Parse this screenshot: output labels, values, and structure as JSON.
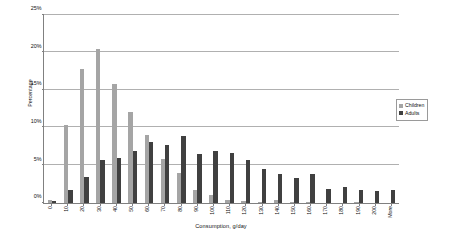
{
  "chart_data": {
    "type": "bar",
    "title": "",
    "xlabel": "Consumption, g/day",
    "ylabel": "Percentage",
    "ylim": [
      0,
      25
    ],
    "ytick_labels": [
      "0%",
      "5%",
      "10%",
      "15%",
      "20%",
      "25%"
    ],
    "ytick_values": [
      0,
      5,
      10,
      15,
      20,
      25
    ],
    "grid": true,
    "legend_position": "right",
    "categories": [
      "0",
      "10",
      "20",
      "30",
      "40",
      "50",
      "60",
      "70",
      "80",
      "90",
      "100",
      "110",
      "120",
      "130",
      "140",
      "150",
      "160",
      "170",
      "180",
      "190",
      "200",
      "More"
    ],
    "series": [
      {
        "name": "Children",
        "color": "#a5a5a5",
        "values": [
          0.3,
          10.3,
          17.8,
          20.4,
          15.8,
          12.1,
          9.0,
          5.8,
          3.9,
          1.6,
          1.0,
          0.4,
          0.2,
          0.1,
          0.3,
          0.05,
          0.05,
          0.0,
          0.0,
          0.05,
          0.0,
          0.0
        ]
      },
      {
        "name": "Adults",
        "color": "#404040",
        "values": [
          0.15,
          1.6,
          3.4,
          5.6,
          5.9,
          6.8,
          8.1,
          7.7,
          8.9,
          6.5,
          6.9,
          6.6,
          5.6,
          4.4,
          3.8,
          3.2,
          3.8,
          1.8,
          2.1,
          1.6,
          1.5,
          1.7
        ]
      }
    ]
  },
  "legend": {
    "items": [
      {
        "label": "Children"
      },
      {
        "label": "Adults"
      }
    ]
  }
}
